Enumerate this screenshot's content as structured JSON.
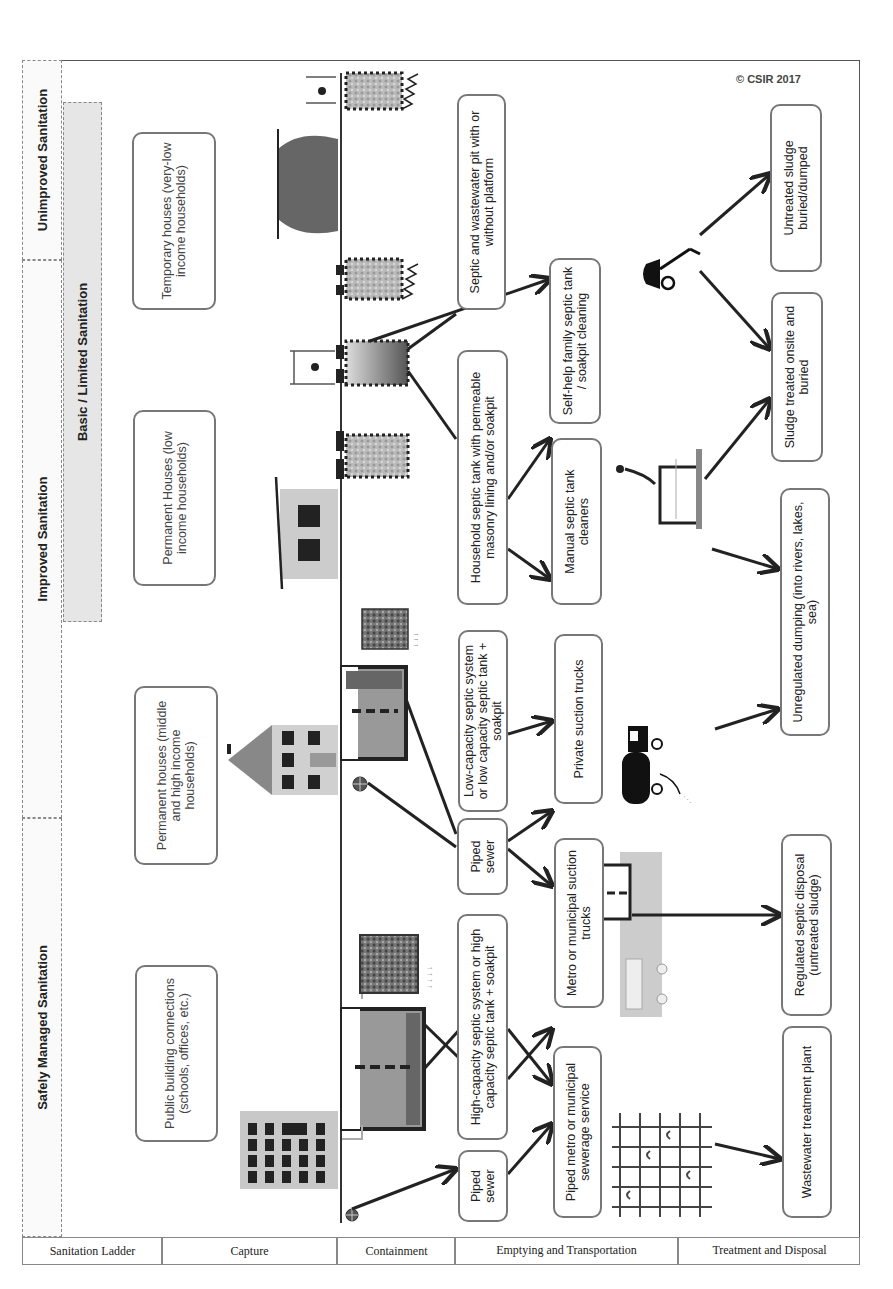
{
  "ladder": {
    "axis_label": "Sanitation Ladder",
    "tiers": [
      {
        "id": "safely-managed",
        "label": "Safely Managed Sanitation"
      },
      {
        "id": "improved",
        "label": "Improved Sanitation"
      },
      {
        "id": "basic-limited",
        "label": "Basic / Limited Sanitation"
      },
      {
        "id": "unimproved",
        "label": "Unimproved Sanitation"
      }
    ]
  },
  "stages": [
    {
      "id": "sanitation-ladder",
      "label": "Sanitation Ladder"
    },
    {
      "id": "capture",
      "label": "Capture"
    },
    {
      "id": "containment",
      "label": "Containment"
    },
    {
      "id": "emptying-transportation",
      "label": "Emptying and Transportation"
    },
    {
      "id": "treatment-disposal",
      "label": "Treatment and Disposal"
    }
  ],
  "capture": [
    {
      "id": "public-building",
      "label": "Public building connections (schools, offices, etc.)"
    },
    {
      "id": "permanent-middle-high",
      "label": "Permanent houses (middle and high income households)"
    },
    {
      "id": "permanent-low",
      "label": "Permanent Houses (low income households)"
    },
    {
      "id": "temporary",
      "label": "Temporary houses (very-low income households)"
    }
  ],
  "containment": [
    {
      "id": "piped-sewer-1",
      "label": "Piped sewer"
    },
    {
      "id": "high-capacity",
      "label": "High-capacity septic system or high capacity septic tank + soakpit"
    },
    {
      "id": "piped-sewer-2",
      "label": "Piped sewer"
    },
    {
      "id": "low-capacity",
      "label": "Low-capacity septic system or low capacity septic tank + soakpit"
    },
    {
      "id": "household-septic",
      "label": "Household septic tank with permeable masonry lining and/or soakpit"
    },
    {
      "id": "septic-wastewater-pit",
      "label": "Septic and wastewater pit with or without platform"
    }
  ],
  "emptying": [
    {
      "id": "piped-metro",
      "label": "Piped metro or municipal sewerage service"
    },
    {
      "id": "metro-suction",
      "label": "Metro or municipal suction trucks"
    },
    {
      "id": "private-suction",
      "label": "Private suction trucks"
    },
    {
      "id": "manual-cleaners",
      "label": "Manual septic tank cleaners"
    },
    {
      "id": "self-help",
      "label": "Self-help family septic tank / soakpit cleaning"
    }
  ],
  "treatment": [
    {
      "id": "wastewater-plant",
      "label": "Wastewater treatment plant"
    },
    {
      "id": "regulated-disposal",
      "label": "Regulated septic disposal (untreated sludge)"
    },
    {
      "id": "unregulated-dumping",
      "label": "Unregulated dumping (into rivers, lakes, sea)"
    },
    {
      "id": "sludge-treated-onsite",
      "label": "Sludge treated onsite and buried"
    },
    {
      "id": "untreated-buried",
      "label": "Untreated sludge buried/dumped"
    }
  ],
  "icons": {
    "office-building": "office-building-icon",
    "house-multi-storey": "multi-storey-house-icon",
    "house-simple": "simple-house-icon",
    "hut": "temporary-hut-icon",
    "septic-tank": "septic-tank-icon",
    "soakpit": "soakpit-icon",
    "manhole": "manhole-icon",
    "latrine": "latrine-icon",
    "sewer-network": "sewer-network-icon",
    "municipal-truck": "municipal-truck-icon",
    "private-truck": "private-truck-icon",
    "manual-cleaner": "manual-cleaner-icon",
    "wheelbarrow": "wheelbarrow-icon"
  },
  "copyright": "© CSIR 2017",
  "colors": {
    "frame": "#555555",
    "tier_fill": "#fafafa",
    "basic_fill": "#e6e6e6",
    "box_border": "#777777",
    "arrow": "#222222"
  }
}
